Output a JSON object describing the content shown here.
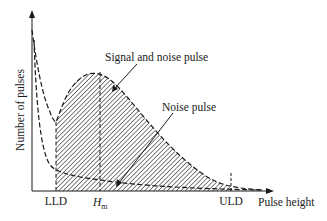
{
  "diagram": {
    "type": "pulse-height-spectrum",
    "axes": {
      "y_label": "Number of pulses",
      "x_label": "Pulse height"
    },
    "markers": {
      "lld": "LLD",
      "hm_main": "H",
      "hm_sub": "m",
      "uld": "ULD"
    },
    "annotations": {
      "signal_and_noise": "Signal and noise pulse",
      "noise": "Noise pulse"
    },
    "colors": {
      "line": "#1a1a1a",
      "background": "#ffffff"
    }
  }
}
